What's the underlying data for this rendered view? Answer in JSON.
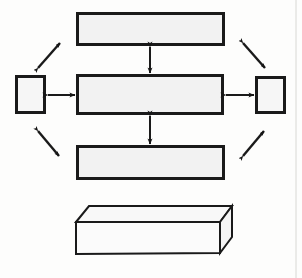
{
  "figure": {
    "title": "Block diagram with central unit, peripheral blocks and open container",
    "background_color": "#fdfdfc",
    "line_color": "#1a1a1a",
    "box_fill": "#f2f2f2",
    "container_fill": "#fbfbfb",
    "page_edge_color": "#d8d8d4",
    "width": 302,
    "height": 278
  },
  "blocks": [
    {
      "id": "top-block",
      "name": "top-block",
      "label": "",
      "x": 76,
      "y": 12,
      "width": 149,
      "height": 34,
      "fill": "#f2f2f2",
      "stroke_width": 3
    },
    {
      "id": "center-block",
      "name": "center-block",
      "label": "",
      "x": 76,
      "y": 74,
      "width": 148,
      "height": 41,
      "fill": "#f2f2f2",
      "stroke_width": 3
    },
    {
      "id": "bottom-block",
      "name": "bottom-block",
      "label": "",
      "x": 76,
      "y": 145,
      "width": 149,
      "height": 35,
      "fill": "#f2f2f2",
      "stroke_width": 3
    },
    {
      "id": "left-block",
      "name": "left-block",
      "label": "",
      "x": 15,
      "y": 75,
      "width": 31,
      "height": 39,
      "fill": "#f6f6f6",
      "stroke_width": 3
    },
    {
      "id": "right-block",
      "name": "right-block",
      "label": "",
      "x": 255,
      "y": 76,
      "width": 31,
      "height": 38,
      "fill": "#f6f6f6",
      "stroke_width": 3
    }
  ],
  "connectors": [
    {
      "id": "arrow-top-center",
      "name": "arrow-top-center-vertical",
      "kind": "double-headed",
      "orientation": "vertical",
      "x1": 150,
      "y1": 47,
      "x2": 150,
      "y2": 73
    },
    {
      "id": "arrow-center-bottom",
      "name": "arrow-center-bottom-vertical",
      "kind": "double-headed",
      "orientation": "vertical",
      "x1": 150,
      "y1": 116,
      "x2": 150,
      "y2": 144
    },
    {
      "id": "arrow-left-center",
      "name": "arrow-left-center-horizontal",
      "kind": "double-headed",
      "orientation": "horizontal",
      "x1": 48,
      "y1": 95,
      "x2": 75,
      "y2": 95
    },
    {
      "id": "arrow-center-right",
      "name": "arrow-center-right-horizontal",
      "kind": "double-headed",
      "orientation": "horizontal",
      "x1": 226,
      "y1": 95,
      "x2": 254,
      "y2": 95
    }
  ],
  "diagonals": [
    {
      "id": "diag-top-left",
      "name": "diagonal-arrow-top-left",
      "kind": "double-headed",
      "x1": 38,
      "y1": 68,
      "x2": 60,
      "y2": 43
    },
    {
      "id": "diag-top-right",
      "name": "diagonal-arrow-top-right",
      "kind": "double-headed",
      "x1": 243,
      "y1": 43,
      "x2": 265,
      "y2": 68
    },
    {
      "id": "diag-bottom-left",
      "name": "diagonal-arrow-bottom-left",
      "kind": "double-headed",
      "x1": 38,
      "y1": 131,
      "x2": 59,
      "y2": 156
    },
    {
      "id": "diag-bottom-right",
      "name": "diagonal-arrow-bottom-right",
      "kind": "double-headed",
      "x1": 243,
      "y1": 156,
      "x2": 264,
      "y2": 131
    }
  ],
  "container": {
    "id": "open-box",
    "name": "open-container-box",
    "label": "",
    "front_top_left": [
      76,
      222
    ],
    "front_top_right": [
      220,
      222
    ],
    "front_bottom_right": [
      220,
      253
    ],
    "front_bottom_left": [
      76,
      254
    ],
    "back_top_left": [
      89,
      206
    ],
    "back_top_right": [
      232,
      206
    ],
    "back_bottom_right": [
      232,
      237
    ],
    "fill_front": "#fbfbfb",
    "fill_side": "#f4f4f4",
    "fill_inner": "#f8f8f8",
    "stroke_width": 2
  },
  "page_edge": {
    "name": "scan-page-edge",
    "x": 296,
    "color": "#d8d8d4"
  }
}
